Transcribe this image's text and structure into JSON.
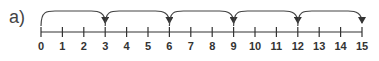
{
  "diagram": {
    "part_label": "a)",
    "number_line": {
      "start": 0,
      "end": 15,
      "tick_labels": [
        "0",
        "1",
        "2",
        "3",
        "4",
        "5",
        "6",
        "7",
        "8",
        "9",
        "10",
        "11",
        "12",
        "13",
        "14",
        "15"
      ]
    },
    "jumps": [
      {
        "from": 0,
        "to": 3
      },
      {
        "from": 3,
        "to": 6
      },
      {
        "from": 6,
        "to": 9
      },
      {
        "from": 9,
        "to": 12
      },
      {
        "from": 12,
        "to": 15
      }
    ],
    "jump_size": 3,
    "colors": {
      "line": "#333333",
      "arc": "#444444",
      "text": "#333333"
    }
  }
}
